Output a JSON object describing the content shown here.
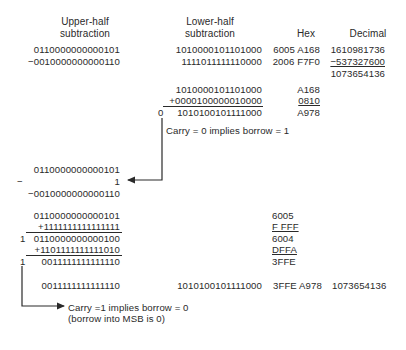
{
  "headers": {
    "upper_1": "Upper-half",
    "upper_2": "subtraction",
    "lower_1": "Lower-half",
    "lower_2": "subtraction",
    "hex": "Hex",
    "decimal": "Decimal"
  },
  "top": {
    "upper_a": "0110000000000101",
    "upper_b": "−0010000000000110",
    "lower_a": "1010000101101000",
    "lower_b": "1111011111110000",
    "hex_a": "6005 A168",
    "hex_b": "2006  F7F0",
    "dec_a": "1610981736",
    "dec_b": "−537327600",
    "dec_result": "1073654136"
  },
  "lower_add": {
    "a": "1010000101101000",
    "b": "+0000100000010000",
    "carry": "0",
    "result": "1010100101111000",
    "hex_a": "A168",
    "hex_b": "0810",
    "hex_result": "A978",
    "note": "Carry = 0  implies borrow = 1"
  },
  "borrow_block": {
    "a": "0110000000000101",
    "minus": "−",
    "one": "1",
    "b": "−0010000000000110"
  },
  "upper_add": {
    "a": "0110000000000101",
    "b": "+1111111111111111",
    "carry1": "1",
    "r1": "0110000000000100",
    "c": "+1101111111111010",
    "carry2": "1",
    "r2": "0011111111111110",
    "hex_a": "6005",
    "hex_b": "F FFF",
    "hex_r1": "6004",
    "hex_c": "DFFA",
    "hex_r2": "3FFE"
  },
  "final": {
    "upper": "0011111111111110",
    "lower": "1010100101111000",
    "hex": "3FFE A978",
    "decimal": "1073654136",
    "note_1": "Carry =1 implies borrow = 0",
    "note_2": "(borrow into MSB is 0)"
  }
}
